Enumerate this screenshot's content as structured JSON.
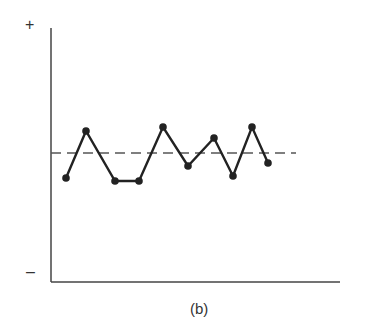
{
  "chart_data": {
    "type": "line",
    "title": "",
    "caption": "(b)",
    "xlabel": "",
    "ylabel": "",
    "y_top_label": "+",
    "y_bottom_label": "–",
    "ylim": [
      -1,
      1
    ],
    "grid": false,
    "legend": null,
    "reference_line": {
      "style": "dashed",
      "value": 0,
      "label": "mean"
    },
    "x": [
      1,
      2,
      3,
      4,
      5,
      6,
      7,
      8,
      9,
      10
    ],
    "series": [
      {
        "name": "observations",
        "values": [
          -0.2,
          0.18,
          -0.22,
          -0.22,
          0.21,
          -0.1,
          0.13,
          -0.18,
          0.21,
          -0.08
        ],
        "marker": "circle",
        "color": "#222222"
      }
    ],
    "pixel_points": [
      [
        66,
        178
      ],
      [
        86,
        131
      ],
      [
        115,
        181
      ],
      [
        139,
        181
      ],
      [
        163,
        127
      ],
      [
        188,
        166
      ],
      [
        214,
        138
      ],
      [
        233,
        176
      ],
      [
        252,
        127
      ],
      [
        268,
        163
      ]
    ]
  },
  "colors": {
    "axis": "#444444",
    "line": "#222222",
    "dash": "#555555"
  }
}
